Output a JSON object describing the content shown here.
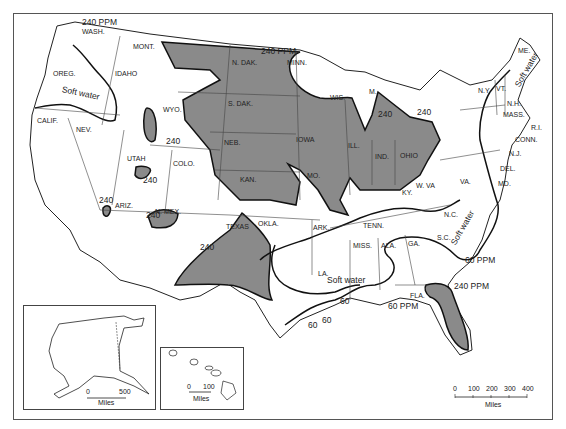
{
  "map": {
    "title": "Water hardness map of the United States",
    "colors": {
      "hard_water_fill": "#8a8a8a",
      "boundary_line": "#111111",
      "state_line": "#444444",
      "background": "#ffffff"
    },
    "states": [
      {
        "label": "WASH.",
        "x": 82,
        "y": 28
      },
      {
        "label": "MONT.",
        "x": 133,
        "y": 43
      },
      {
        "label": "OREG.",
        "x": 53,
        "y": 70
      },
      {
        "label": "IDAHO",
        "x": 115,
        "y": 70
      },
      {
        "label": "WYO.",
        "x": 163,
        "y": 106
      },
      {
        "label": "CALIF.",
        "x": 37,
        "y": 117
      },
      {
        "label": "NEV.",
        "x": 76,
        "y": 126
      },
      {
        "label": "UTAH",
        "x": 127,
        "y": 155
      },
      {
        "label": "COLO.",
        "x": 173,
        "y": 160
      },
      {
        "label": "ARIZ.",
        "x": 115,
        "y": 202
      },
      {
        "label": "N. MEX.",
        "x": 155,
        "y": 208
      },
      {
        "label": "N. DAK.",
        "x": 232,
        "y": 59
      },
      {
        "label": "S. DAK.",
        "x": 228,
        "y": 100
      },
      {
        "label": "MINN.",
        "x": 287,
        "y": 59
      },
      {
        "label": "NEB.",
        "x": 224,
        "y": 139
      },
      {
        "label": "IOWA",
        "x": 296,
        "y": 136
      },
      {
        "label": "KAN.",
        "x": 240,
        "y": 176
      },
      {
        "label": "MO.",
        "x": 307,
        "y": 172
      },
      {
        "label": "ILL.",
        "x": 348,
        "y": 142
      },
      {
        "label": "WIS.",
        "x": 330,
        "y": 94
      },
      {
        "label": "M.",
        "x": 369,
        "y": 88
      },
      {
        "label": "IND.",
        "x": 375,
        "y": 153
      },
      {
        "label": "OHIO",
        "x": 400,
        "y": 152
      },
      {
        "label": "KY.",
        "x": 402,
        "y": 189
      },
      {
        "label": "W. VA",
        "x": 416,
        "y": 182
      },
      {
        "label": "VA.",
        "x": 460,
        "y": 178
      },
      {
        "label": "OKLA.",
        "x": 258,
        "y": 220
      },
      {
        "label": "TEXAS",
        "x": 226,
        "y": 223
      },
      {
        "label": "ARK.",
        "x": 313,
        "y": 224
      },
      {
        "label": "TENN.",
        "x": 363,
        "y": 222
      },
      {
        "label": "N.C.",
        "x": 444,
        "y": 211
      },
      {
        "label": "MISS.",
        "x": 353,
        "y": 242
      },
      {
        "label": "ALA.",
        "x": 381,
        "y": 242
      },
      {
        "label": "GA.",
        "x": 408,
        "y": 240
      },
      {
        "label": "S.C.",
        "x": 437,
        "y": 234
      },
      {
        "label": "LA.",
        "x": 318,
        "y": 270
      },
      {
        "label": "FLA.",
        "x": 410,
        "y": 292
      },
      {
        "label": "N.Y.",
        "x": 478,
        "y": 87
      },
      {
        "label": "VT.",
        "x": 496,
        "y": 85
      },
      {
        "label": "ME.",
        "x": 518,
        "y": 47
      },
      {
        "label": "N.H.",
        "x": 507,
        "y": 100
      },
      {
        "label": "MASS.",
        "x": 503,
        "y": 111
      },
      {
        "label": "CONN.",
        "x": 515,
        "y": 136
      },
      {
        "label": "R.I.",
        "x": 531,
        "y": 124
      },
      {
        "label": "N.J.",
        "x": 509,
        "y": 150
      },
      {
        "label": "DEL.",
        "x": 500,
        "y": 165
      },
      {
        "label": "MD.",
        "x": 498,
        "y": 180
      }
    ],
    "hardness_labels": [
      {
        "label": "240 PPM",
        "x": 82,
        "y": 18
      },
      {
        "label": "240 PPM",
        "x": 261,
        "y": 47
      },
      {
        "label": "240",
        "x": 166,
        "y": 137
      },
      {
        "label": "240",
        "x": 143,
        "y": 176
      },
      {
        "label": "240",
        "x": 99,
        "y": 196
      },
      {
        "label": "240",
        "x": 146,
        "y": 211
      },
      {
        "label": "240",
        "x": 200,
        "y": 243
      },
      {
        "label": "240",
        "x": 378,
        "y": 110
      },
      {
        "label": "240",
        "x": 417,
        "y": 108
      },
      {
        "label": "60 PPM",
        "x": 465,
        "y": 256
      },
      {
        "label": "240 PPM",
        "x": 454,
        "y": 282
      },
      {
        "label": "60",
        "x": 340,
        "y": 297
      },
      {
        "label": "60",
        "x": 322,
        "y": 316
      },
      {
        "label": "60",
        "x": 308,
        "y": 321
      },
      {
        "label": "60 PPM",
        "x": 388,
        "y": 302
      }
    ],
    "soft_water_labels": [
      {
        "label": "Soft water",
        "x": 62,
        "y": 85,
        "rotate": 12
      },
      {
        "label": "Soft water",
        "x": 327,
        "y": 276,
        "rotate": 0
      },
      {
        "label": "Soft water",
        "x": 453,
        "y": 240,
        "rotate": -60
      },
      {
        "label": "Soft water",
        "x": 517,
        "y": 82,
        "rotate": -60
      }
    ],
    "insets": {
      "alaska": {
        "scale_labels": [
          "0",
          "500"
        ],
        "unit": "Miles"
      },
      "hawaii": {
        "scale_labels": [
          "0",
          "100"
        ],
        "unit": "Miles"
      }
    },
    "main_scale": {
      "scale_labels": [
        "0",
        "100",
        "200",
        "300",
        "400"
      ],
      "unit": "Miles"
    }
  }
}
